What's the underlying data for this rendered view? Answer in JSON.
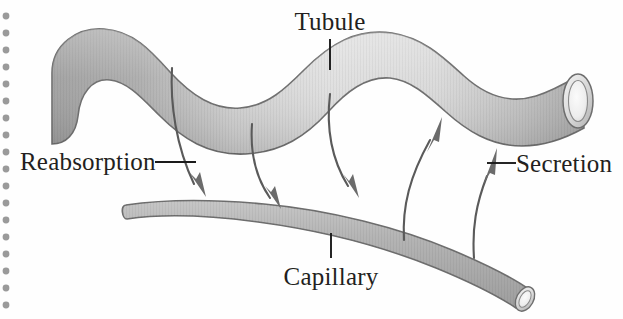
{
  "figure": {
    "background_color": "#fefefe",
    "width": 623,
    "height": 319
  },
  "labels": {
    "tubule": "Tubule",
    "capillary": "Capillary",
    "reabsorption": "Reabsorption",
    "secretion": "Secretion"
  },
  "colors": {
    "label_text": "#231f20",
    "leader_line": "#1a1a1a",
    "arrow_stroke": "#5a5a5a",
    "arrow_head": "#6b6b6b",
    "vessel_outline": "#6e6e6e",
    "tubule_dark": "#a3a3a3",
    "tubule_light": "#e2e2e2",
    "capillary_fill": "#b2b2b2",
    "lumen_fill": "#efefef",
    "binding_dot": "#9a9a9a"
  },
  "structures": [
    {
      "name": "tubule",
      "label": "Tubule",
      "description": "Wavy tubular vessel across the upper portion, closed rounded left end and open elliptical lumen at the right end",
      "shading": "light gray gradient, darker at the left end"
    },
    {
      "name": "capillary",
      "label": "Capillary",
      "description": "Gently curved vessel across the lower portion, rounded left end and open elliptical lumen at the lower right end",
      "shading": "medium gray"
    }
  ],
  "flows": [
    {
      "name": "reabsorption",
      "label": "Reabsorption",
      "direction": "tubule-to-capillary",
      "arrow_count": 3
    },
    {
      "name": "secretion",
      "label": "Secretion",
      "direction": "capillary-to-tubule",
      "arrow_count": 2
    }
  ],
  "binding_dots": {
    "name": "spiral-binding-holes",
    "count": 18,
    "x": 6,
    "start_y": 16,
    "spacing": 17,
    "radius": 3.4
  }
}
